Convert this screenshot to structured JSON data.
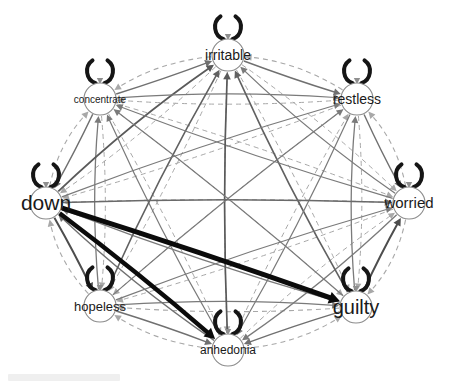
{
  "figure": {
    "background": "#ffffff"
  },
  "palette": {
    "node_fill": "#ffffff",
    "node_border": "#8c8c8c",
    "label_color": "#1a1a1a",
    "solid_edge": "#707070",
    "dashed_edge": "#a8a8a8",
    "strong_edge": "#0b0b0b",
    "self_loop": "#151515",
    "loop_arrow": "#8f8f8f"
  },
  "network": {
    "node_radius": 16,
    "self_loop_width": 4,
    "nodes": [
      {
        "id": "irritable",
        "label": "irritable",
        "x": 228,
        "y": 55,
        "font_size": 14
      },
      {
        "id": "restless",
        "label": "restless",
        "x": 357,
        "y": 99,
        "font_size": 14
      },
      {
        "id": "worried",
        "label": "worried",
        "x": 409,
        "y": 203,
        "font_size": 15
      },
      {
        "id": "guilty",
        "label": "guilty",
        "x": 356,
        "y": 307,
        "font_size": 20
      },
      {
        "id": "anhedonia",
        "label": "anhedonia",
        "x": 228,
        "y": 350,
        "font_size": 12
      },
      {
        "id": "hopeless",
        "label": "hopeless",
        "x": 100,
        "y": 306,
        "font_size": 13
      },
      {
        "id": "down",
        "label": "down",
        "x": 46,
        "y": 203,
        "font_size": 21
      },
      {
        "id": "concentrate",
        "label": "concentrate",
        "x": 100,
        "y": 99,
        "font_size": 10
      }
    ],
    "edges": [
      {
        "from": "irritable",
        "to": "restless",
        "style": "solid",
        "width": 1.4,
        "color": "#707070",
        "curve": -2
      },
      {
        "from": "restless",
        "to": "irritable",
        "style": "dashed",
        "width": 1.1,
        "color": "#a8a8a8",
        "curve": 16
      },
      {
        "from": "restless",
        "to": "worried",
        "style": "solid",
        "width": 1.4,
        "color": "#707070",
        "curve": -2
      },
      {
        "from": "worried",
        "to": "restless",
        "style": "dashed",
        "width": 1.1,
        "color": "#a8a8a8",
        "curve": 16
      },
      {
        "from": "worried",
        "to": "guilty",
        "style": "dashed",
        "width": 1.1,
        "color": "#a8a8a8",
        "curve": 16
      },
      {
        "from": "guilty",
        "to": "worried",
        "style": "solid",
        "width": 2.0,
        "color": "#4d4d4d",
        "curve": -2
      },
      {
        "from": "guilty",
        "to": "anhedonia",
        "style": "solid",
        "width": 1.4,
        "color": "#707070",
        "curve": -2
      },
      {
        "from": "anhedonia",
        "to": "guilty",
        "style": "dashed",
        "width": 1.1,
        "color": "#a8a8a8",
        "curve": 16
      },
      {
        "from": "anhedonia",
        "to": "hopeless",
        "style": "dashed",
        "width": 1.1,
        "color": "#a8a8a8",
        "curve": 16
      },
      {
        "from": "hopeless",
        "to": "anhedonia",
        "style": "solid",
        "width": 1.4,
        "color": "#707070",
        "curve": -2
      },
      {
        "from": "hopeless",
        "to": "down",
        "style": "dashed",
        "width": 1.1,
        "color": "#a8a8a8",
        "curve": 16
      },
      {
        "from": "down",
        "to": "hopeless",
        "style": "solid",
        "width": 2.0,
        "color": "#4d4d4d",
        "curve": -2
      },
      {
        "from": "down",
        "to": "concentrate",
        "style": "dashed",
        "width": 1.1,
        "color": "#a8a8a8",
        "curve": 16
      },
      {
        "from": "concentrate",
        "to": "down",
        "style": "solid",
        "width": 1.5,
        "color": "#707070",
        "curve": -2
      },
      {
        "from": "concentrate",
        "to": "irritable",
        "style": "solid",
        "width": 1.4,
        "color": "#707070",
        "curve": -2
      },
      {
        "from": "irritable",
        "to": "concentrate",
        "style": "dashed",
        "width": 1.1,
        "color": "#a8a8a8",
        "curve": 16
      },
      {
        "from": "irritable",
        "to": "worried",
        "style": "dashed",
        "width": 1.0,
        "color": "#a8a8a8",
        "curve": 9
      },
      {
        "from": "worried",
        "to": "irritable",
        "style": "solid",
        "width": 1.3,
        "color": "#7a7a7a",
        "curve": -9
      },
      {
        "from": "restless",
        "to": "guilty",
        "style": "dashed",
        "width": 1.0,
        "color": "#a8a8a8",
        "curve": 9
      },
      {
        "from": "guilty",
        "to": "restless",
        "style": "solid",
        "width": 1.3,
        "color": "#7a7a7a",
        "curve": -9
      },
      {
        "from": "worried",
        "to": "anhedonia",
        "style": "solid",
        "width": 1.3,
        "color": "#7a7a7a",
        "curve": 9
      },
      {
        "from": "anhedonia",
        "to": "worried",
        "style": "dashed",
        "width": 1.0,
        "color": "#a8a8a8",
        "curve": -9
      },
      {
        "from": "guilty",
        "to": "hopeless",
        "style": "dashed",
        "width": 1.1,
        "color": "#a8a8a8",
        "curve": 9
      },
      {
        "from": "hopeless",
        "to": "guilty",
        "style": "solid",
        "width": 1.3,
        "color": "#7a7a7a",
        "curve": -9
      },
      {
        "from": "anhedonia",
        "to": "down",
        "style": "solid",
        "width": 1.4,
        "color": "#707070",
        "curve": 9
      },
      {
        "from": "down",
        "to": "anhedonia",
        "style": "solid",
        "width": 4.5,
        "color": "#0b0b0b",
        "curve": -4
      },
      {
        "from": "hopeless",
        "to": "concentrate",
        "style": "solid",
        "width": 1.3,
        "color": "#7a7a7a",
        "curve": 9
      },
      {
        "from": "concentrate",
        "to": "hopeless",
        "style": "dashed",
        "width": 1.0,
        "color": "#a8a8a8",
        "curve": -9
      },
      {
        "from": "down",
        "to": "irritable",
        "style": "solid",
        "width": 1.8,
        "color": "#5a5a5a",
        "curve": 9
      },
      {
        "from": "irritable",
        "to": "down",
        "style": "dashed",
        "width": 1.0,
        "color": "#a8a8a8",
        "curve": -9
      },
      {
        "from": "concentrate",
        "to": "restless",
        "style": "solid",
        "width": 1.2,
        "color": "#7a7a7a",
        "curve": 9
      },
      {
        "from": "restless",
        "to": "concentrate",
        "style": "dashed",
        "width": 1.0,
        "color": "#a8a8a8",
        "curve": -9
      },
      {
        "from": "irritable",
        "to": "guilty",
        "style": "dashed",
        "width": 1.0,
        "color": "#a8a8a8",
        "curve": 7
      },
      {
        "from": "guilty",
        "to": "irritable",
        "style": "solid",
        "width": 1.6,
        "color": "#616161",
        "curve": -7
      },
      {
        "from": "restless",
        "to": "anhedonia",
        "style": "solid",
        "width": 1.2,
        "color": "#7a7a7a",
        "curve": 7
      },
      {
        "from": "anhedonia",
        "to": "restless",
        "style": "dashed",
        "width": 1.0,
        "color": "#a8a8a8",
        "curve": -7
      },
      {
        "from": "worried",
        "to": "hopeless",
        "style": "dashed",
        "width": 1.0,
        "color": "#a8a8a8",
        "curve": 7
      },
      {
        "from": "hopeless",
        "to": "worried",
        "style": "solid",
        "width": 1.2,
        "color": "#7a7a7a",
        "curve": -7
      },
      {
        "from": "guilty",
        "to": "down",
        "style": "solid",
        "width": 1.3,
        "color": "#7a7a7a",
        "curve": 7
      },
      {
        "from": "down",
        "to": "guilty",
        "style": "solid",
        "width": 5,
        "color": "#0b0b0b",
        "curve": -3
      },
      {
        "from": "anhedonia",
        "to": "concentrate",
        "style": "solid",
        "width": 1.2,
        "color": "#7a7a7a",
        "curve": 7
      },
      {
        "from": "concentrate",
        "to": "anhedonia",
        "style": "dashed",
        "width": 1.0,
        "color": "#a8a8a8",
        "curve": -7
      },
      {
        "from": "hopeless",
        "to": "irritable",
        "style": "solid",
        "width": 1.6,
        "color": "#616161",
        "curve": 7
      },
      {
        "from": "irritable",
        "to": "hopeless",
        "style": "dashed",
        "width": 1.0,
        "color": "#a8a8a8",
        "curve": -7
      },
      {
        "from": "down",
        "to": "restless",
        "style": "solid",
        "width": 1.2,
        "color": "#7a7a7a",
        "curve": 7
      },
      {
        "from": "restless",
        "to": "down",
        "style": "dashed",
        "width": 1.0,
        "color": "#a8a8a8",
        "curve": -7
      },
      {
        "from": "concentrate",
        "to": "worried",
        "style": "dashed",
        "width": 1.0,
        "color": "#a8a8a8",
        "curve": 7
      },
      {
        "from": "worried",
        "to": "concentrate",
        "style": "solid",
        "width": 1.2,
        "color": "#7a7a7a",
        "curve": -7
      },
      {
        "from": "irritable",
        "to": "anhedonia",
        "style": "dashed",
        "width": 1.0,
        "color": "#a8a8a8",
        "curve": 6
      },
      {
        "from": "anhedonia",
        "to": "irritable",
        "style": "solid",
        "width": 1.7,
        "color": "#5a5a5a",
        "curve": -6
      },
      {
        "from": "restless",
        "to": "hopeless",
        "style": "dashed",
        "width": 1.0,
        "color": "#a8a8a8",
        "curve": 6
      },
      {
        "from": "hopeless",
        "to": "restless",
        "style": "solid",
        "width": 1.2,
        "color": "#7a7a7a",
        "curve": -6
      },
      {
        "from": "worried",
        "to": "down",
        "style": "dashed",
        "width": 1.1,
        "color": "#a8a8a8",
        "curve": 6
      },
      {
        "from": "down",
        "to": "worried",
        "style": "solid",
        "width": 1.5,
        "color": "#6a6a6a",
        "curve": -6
      },
      {
        "from": "guilty",
        "to": "concentrate",
        "style": "solid",
        "width": 1.2,
        "color": "#7a7a7a",
        "curve": 6
      },
      {
        "from": "concentrate",
        "to": "guilty",
        "style": "dashed",
        "width": 1.0,
        "color": "#a8a8a8",
        "curve": -6
      }
    ]
  }
}
